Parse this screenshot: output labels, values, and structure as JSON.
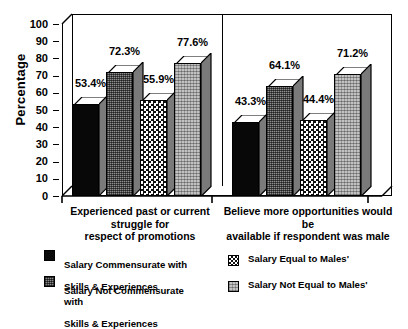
{
  "chart_data": {
    "type": "bar",
    "title": "",
    "xlabel": "",
    "ylabel": "Percentage",
    "ylim": [
      0,
      100
    ],
    "yticks": [
      0,
      10,
      20,
      30,
      40,
      50,
      60,
      70,
      80,
      90,
      100
    ],
    "ytick_labels": [
      "0",
      "10",
      "20",
      "30",
      "40",
      "50",
      "60",
      "70",
      "80",
      "90",
      "100"
    ],
    "grid": false,
    "legend_position": "bottom",
    "value_suffix": "%",
    "categories": [
      "Experienced past or current struggle for\nrespect of promotions",
      "Believe more opportunities would be\navailable if respondent was male"
    ],
    "series": [
      {
        "name": "Salary Commensurate with\nSkills & Experiences",
        "pattern": "solid-black",
        "values": [
          53.4,
          43.3
        ],
        "labels": [
          "53.4%",
          "43.3%"
        ]
      },
      {
        "name": "Salary Not Commensurate with\nSkills & Experiences",
        "pattern": "medium-gray-dither",
        "values": [
          72.3,
          64.1
        ],
        "labels": [
          "72.3%",
          "64.1%"
        ]
      },
      {
        "name": "Salary Equal to Males'",
        "pattern": "coarse-checker",
        "values": [
          55.9,
          44.4
        ],
        "labels": [
          "55.9%",
          "44.4%"
        ]
      },
      {
        "name": "Salary Not Equal to Males'",
        "pattern": "light-gray-dither",
        "values": [
          77.6,
          71.2
        ],
        "labels": [
          "77.6%",
          "71.2%"
        ]
      }
    ]
  },
  "axis": {
    "y_title": "Percentage",
    "ticks": [
      "100",
      "90",
      "80",
      "70",
      "60",
      "50",
      "40",
      "30",
      "20",
      "10",
      "0"
    ]
  },
  "categories": {
    "group1_line1": "Experienced past or current struggle for",
    "group1_line2": "respect of promotions",
    "group2_line1": "Believe more opportunities would be",
    "group2_line2": "available if respondent was male"
  },
  "values": {
    "g1s1": "53.4%",
    "g1s2": "72.3%",
    "g1s3": "55.9%",
    "g1s4": "77.6%",
    "g2s1": "43.3%",
    "g2s2": "64.1%",
    "g2s3": "44.4%",
    "g2s4": "71.2%"
  },
  "legend": {
    "item1_line1": "Salary Commensurate with",
    "item1_line2": "Skills & Experiences",
    "item2_line1": "Salary Not Commensurate with",
    "item2_line2": "Skills & Experiences",
    "item3": "Salary Equal to Males'",
    "item4": "Salary Not Equal to Males'"
  },
  "colors": {
    "axis": "#000000",
    "background": "#ffffff",
    "series1": "#0a0a0a",
    "series2": "#8e8e8e",
    "series3": "#ffffff",
    "series4": "#c2c2c2"
  }
}
